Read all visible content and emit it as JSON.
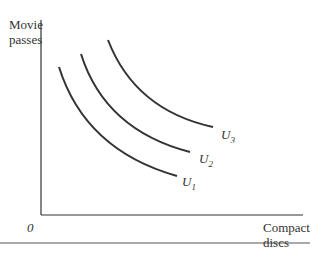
{
  "diagram": {
    "type": "indifference-curves",
    "y_axis_label": [
      "Movie",
      "passes"
    ],
    "x_axis_label": [
      "Compact",
      "discs"
    ],
    "origin_label": "0",
    "curves": [
      {
        "name": "U1",
        "base": "U",
        "sub": "1"
      },
      {
        "name": "U2",
        "base": "U",
        "sub": "2"
      },
      {
        "name": "U3",
        "base": "U",
        "sub": "3"
      }
    ]
  }
}
